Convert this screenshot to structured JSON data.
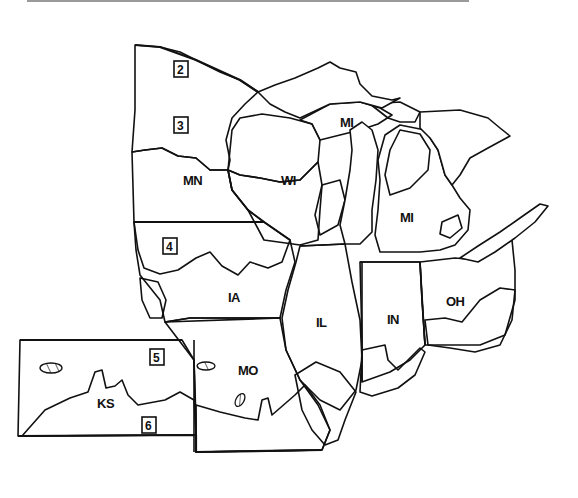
{
  "map": {
    "type": "regional zone map",
    "region": "Upper Midwest / Corn Belt, USA",
    "fill_patterns": {
      "fine-dash-hatch": "light diagonal dashes (northern forest zone)",
      "dense-diagonal-hatch": "dense left-leaning hatch",
      "dot-stipple": "dotted fill",
      "sparse-diagonal-hatch": "wide right-leaning hatch (southern zone)"
    },
    "colors": {
      "ink": "#111111",
      "paper": "#ffffff",
      "rule": "#9a9a9a"
    },
    "states": [
      {
        "abbr": "MN"
      },
      {
        "abbr": "WI"
      },
      {
        "abbr": "MI",
        "note": "upper peninsula label"
      },
      {
        "abbr": "MI",
        "note": "lower peninsula label"
      },
      {
        "abbr": "IA"
      },
      {
        "abbr": "IL"
      },
      {
        "abbr": "IN"
      },
      {
        "abbr": "OH"
      },
      {
        "abbr": "MO"
      },
      {
        "abbr": "KS"
      }
    ],
    "zone_markers": [
      "2",
      "3",
      "4",
      "5",
      "6"
    ]
  }
}
